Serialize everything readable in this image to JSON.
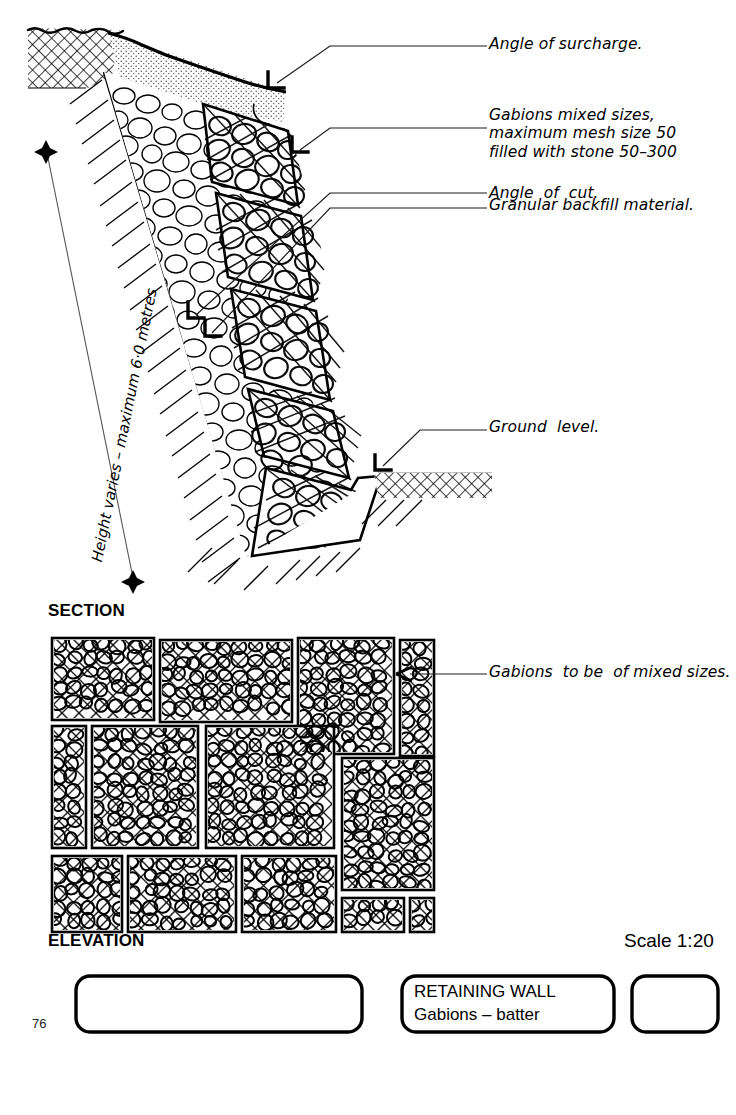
{
  "drawing": {
    "title_block": {
      "main_title": "RETAINING WALL",
      "subtitle": "Gabions – batter",
      "scale": "Scale 1:20",
      "page_number": "76",
      "left_box_text": "",
      "right_box_text": ""
    },
    "view_labels": {
      "section": "SECTION",
      "elevation": "ELEVATION"
    },
    "dimension": {
      "height_note": "Height varies – maximum 6·0 metres"
    },
    "section_annotations": [
      {
        "id": "angle-of-surcharge",
        "text": "Angle of surcharge."
      },
      {
        "id": "gabions-mixed-sizes",
        "text": "Gabions mixed sizes,\nmaximum mesh size 50\nfilled with stone 50–300"
      },
      {
        "id": "angle-of-cut",
        "text": "Angle  of  cut."
      },
      {
        "id": "granular-backfill",
        "text": "Granular backfill material."
      },
      {
        "id": "ground-level",
        "text": "Ground  level."
      }
    ],
    "elevation_annotations": [
      {
        "id": "gabions-mixed-sizes-elevation",
        "text": "Gabions  to be  of mixed sizes."
      }
    ],
    "colors": {
      "ink": "#000000",
      "paper": "#ffffff",
      "leader": "#1a1a1a",
      "stipple": "#7a7a7a"
    }
  },
  "chart_data": {
    "type": "diagram",
    "views": [
      "SECTION",
      "ELEVATION"
    ],
    "scale": "1:20",
    "max_height_metres": 6.0,
    "mesh_size_mm": 50,
    "stone_size_mm": [
      50,
      300
    ],
    "gabion_courses": 5,
    "elevation_basket_count": 13
  }
}
